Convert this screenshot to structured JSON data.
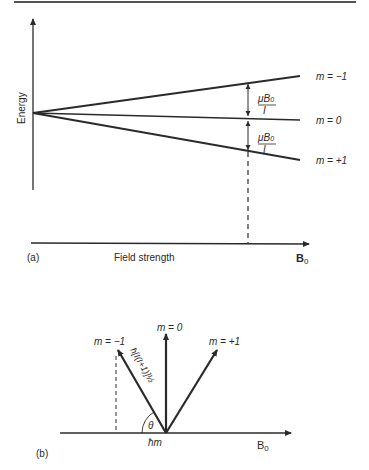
{
  "figure_a": {
    "panel_label": "(a)",
    "y_axis_label": "Energy",
    "x_axis_label": "Field strength",
    "x_axis_symbol": "B",
    "x_axis_symbol_sub": "0",
    "levels": [
      {
        "label": "m = −1",
        "m": -1
      },
      {
        "label": "m = 0",
        "m": 0
      },
      {
        "label": "m = +1",
        "m": 1
      }
    ],
    "splitting_label_num": "μB",
    "splitting_label_sub": "0",
    "splitting_label_den": "I"
  },
  "figure_b": {
    "panel_label": "(b)",
    "axis_symbol": "B",
    "axis_symbol_sub": "0",
    "vectors": [
      {
        "label": "m = −1"
      },
      {
        "label": "m = 0"
      },
      {
        "label": "m = +1"
      }
    ],
    "angle_label": "θ",
    "projection_label": "ħm",
    "magnitude_label": "ħ[I(I+1)]½"
  },
  "colors": {
    "line": "#2a2a2a",
    "background": "#ffffff"
  }
}
